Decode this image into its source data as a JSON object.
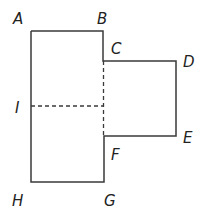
{
  "diagram": {
    "stroke_color": "#3a3a3a",
    "labels": {
      "A": "A",
      "B": "B",
      "C": "C",
      "D": "D",
      "E": "E",
      "F": "F",
      "G": "G",
      "H": "H",
      "I": "I"
    },
    "solid_outline": [
      "A",
      "B",
      "C",
      "D",
      "E",
      "F",
      "G",
      "H"
    ],
    "dashed_segments": [
      [
        "C",
        "F"
      ],
      [
        "I",
        "midpoint of CF"
      ]
    ]
  }
}
